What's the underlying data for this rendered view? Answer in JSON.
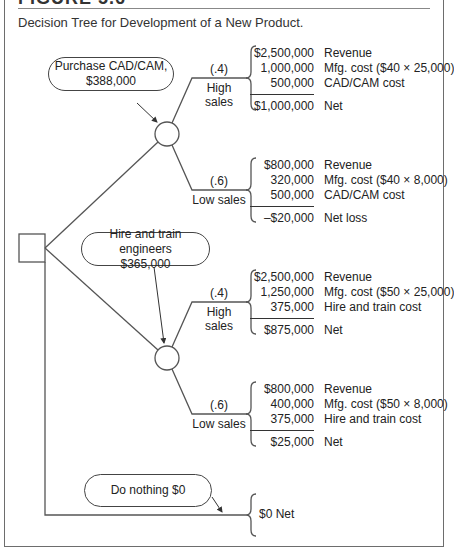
{
  "figure": {
    "heading": "FIGURE 5.6",
    "caption": "Decision Tree for Development of a New Product."
  },
  "decisions": [
    {
      "id": "cadcam",
      "label_line1": "Purchase CAD/CAM,",
      "label_line2": "$388,000",
      "branches": [
        {
          "probability": "(.4)",
          "name": "High sales",
          "rows": [
            {
              "amount": "$2,500,000",
              "label": "Revenue"
            },
            {
              "amount": "1,000,000",
              "label": "Mfg. cost ($40 × 25,000)"
            },
            {
              "amount": "500,000",
              "label": "CAD/CAM cost"
            }
          ],
          "result": {
            "amount": "$1,000,000",
            "label": "Net"
          }
        },
        {
          "probability": "(.6)",
          "name": "Low sales",
          "rows": [
            {
              "amount": "$800,000",
              "label": "Revenue"
            },
            {
              "amount": "320,000",
              "label": "Mfg. cost ($40 × 8,000)"
            },
            {
              "amount": "500,000",
              "label": "CAD/CAM cost"
            }
          ],
          "result": {
            "amount": "–$20,000",
            "label": "Net loss"
          }
        }
      ]
    },
    {
      "id": "hire",
      "label_line1": "Hire and train engineers",
      "label_line2": "$365,000",
      "branches": [
        {
          "probability": "(.4)",
          "name": "High sales",
          "rows": [
            {
              "amount": "$2,500,000",
              "label": "Revenue"
            },
            {
              "amount": "1,250,000",
              "label": "Mfg. cost ($50 × 25,000)"
            },
            {
              "amount": "375,000",
              "label": "Hire and train cost"
            }
          ],
          "result": {
            "amount": "$875,000",
            "label": "Net"
          }
        },
        {
          "probability": "(.6)",
          "name": "Low sales",
          "rows": [
            {
              "amount": "$800,000",
              "label": "Revenue"
            },
            {
              "amount": "400,000",
              "label": "Mfg. cost ($50 × 8,000)"
            },
            {
              "amount": "375,000",
              "label": "Hire and train cost"
            }
          ],
          "result": {
            "amount": "$25,000",
            "label": "Net"
          }
        }
      ]
    },
    {
      "id": "nothing",
      "label_line1": "Do nothing $0",
      "result": "$0 Net"
    }
  ],
  "colors": {
    "line": "#555555",
    "frame": "#6d6d6d",
    "text": "#222222"
  }
}
